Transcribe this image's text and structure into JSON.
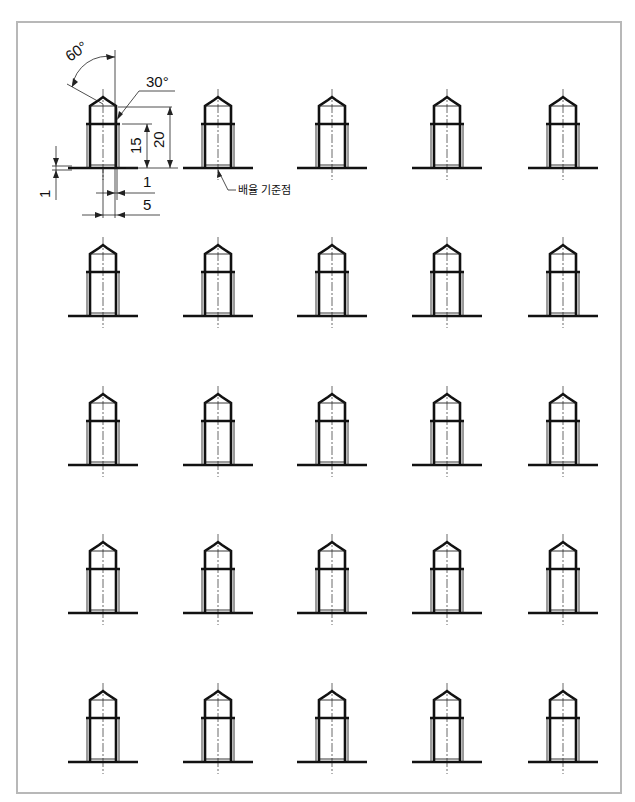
{
  "drawing": {
    "title": "Bolt practice sheet",
    "grid": {
      "rows": 5,
      "columns": 5
    },
    "colors": {
      "line": "#111111",
      "frame": "#b8b8b8",
      "background": "#ffffff"
    },
    "dimensions": {
      "tip_angle": "60°",
      "chamfer_angle": "30°",
      "thread_height": "15",
      "total_height": "20",
      "base_thickness": "1",
      "offset_small": "1",
      "offset_large": "5"
    },
    "callout": "배율 기준점"
  }
}
